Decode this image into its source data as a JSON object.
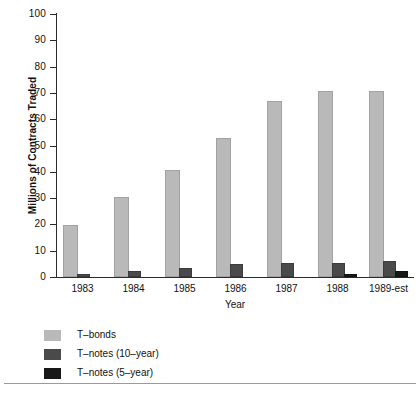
{
  "chart_data": {
    "type": "bar",
    "title": "",
    "xlabel": "Year",
    "ylabel": "Millions of Contracts Traded",
    "categories": [
      "1983",
      "1984",
      "1985",
      "1986",
      "1987",
      "1988",
      "1989-est"
    ],
    "ylim": [
      0,
      100
    ],
    "yticks": [
      0,
      10,
      20,
      30,
      40,
      50,
      60,
      70,
      80,
      90,
      100
    ],
    "ytick_labels": [
      "0",
      "10",
      "20",
      "30",
      "40",
      "50",
      "60",
      "70",
      "80",
      "90",
      "100"
    ],
    "grid": false,
    "legend_position": "below-left",
    "series": [
      {
        "name": "T-bonds",
        "color": "#b9b9b9",
        "values": [
          19,
          29.5,
          40,
          52,
          66,
          70,
          70
        ]
      },
      {
        "name": "T-notes (10-year)",
        "color": "#4a4a4a",
        "values": [
          0.5,
          1.5,
          2.5,
          4,
          4.5,
          4.5,
          5.5
        ]
      },
      {
        "name": "T-notes (5-year)",
        "color": "#181818",
        "values": [
          0,
          0,
          0,
          0,
          0,
          0.3,
          1.5
        ]
      }
    ]
  },
  "legend": {
    "items": [
      {
        "label": "T–bonds",
        "key": "tbond"
      },
      {
        "label": "T–notes (10–year)",
        "key": "tnote10"
      },
      {
        "label": "T–notes (5–year)",
        "key": "tnote5"
      }
    ]
  },
  "axes": {
    "x_title": "Year",
    "y_title": "Millions of Contracts Traded"
  }
}
